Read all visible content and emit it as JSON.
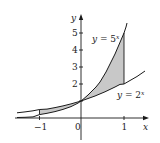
{
  "diagram": {
    "type": "function-graph",
    "axes": {
      "x_label": "x",
      "y_label": "y",
      "origin_label": "0",
      "x_ticks": [
        {
          "value": -1,
          "label": "−1"
        },
        {
          "value": 1,
          "label": "1"
        }
      ],
      "y_ticks": [
        {
          "value": 1,
          "label": ""
        },
        {
          "value": 2,
          "label": "2"
        },
        {
          "value": 3,
          "label": "3"
        },
        {
          "value": 4,
          "label": "4"
        },
        {
          "value": 5,
          "label": "5"
        }
      ]
    },
    "curves": [
      {
        "name": "y = 5^x",
        "label_text": "y = 5",
        "label_exp": "x",
        "base": 5
      },
      {
        "name": "y = 2^x",
        "label_text": "y = 2",
        "label_exp": "x",
        "base": 2
      }
    ],
    "shaded_regions": [
      {
        "from_x": -1,
        "to_x": 0,
        "between": [
          "y = 2^x",
          "y = 5^x"
        ]
      },
      {
        "from_x": 0,
        "to_x": 1,
        "between": [
          "y = 2^x",
          "y = 5^x"
        ]
      }
    ],
    "colors": {
      "shade": "#c8c8c8",
      "curve": "#1a1a1a",
      "axis": "#1a1a1a"
    }
  }
}
